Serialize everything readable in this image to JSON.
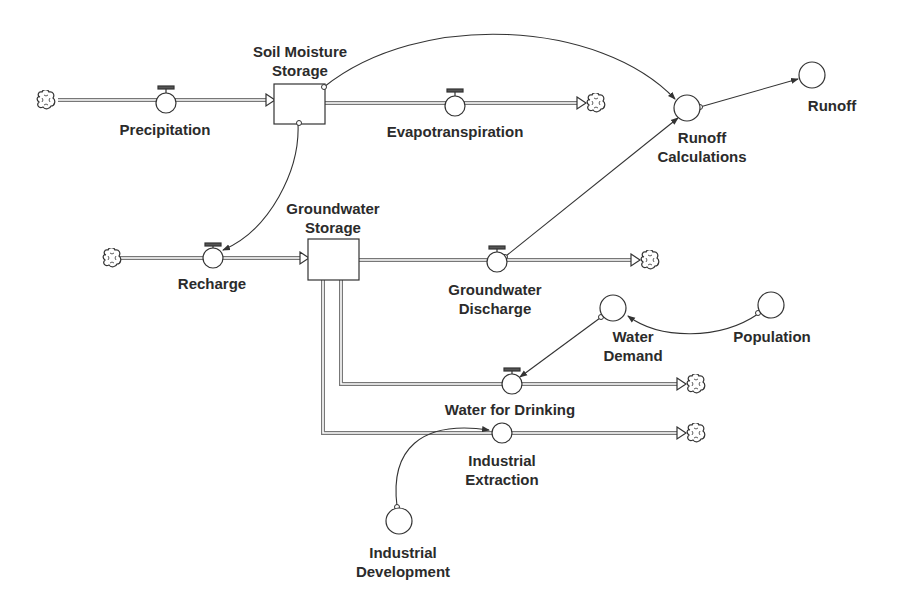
{
  "diagram": {
    "type": "stock-and-flow",
    "stocks": [
      {
        "id": "soil",
        "label": "Soil Moisture Storage",
        "line1": "Soil Moisture",
        "line2": "Storage"
      },
      {
        "id": "gw",
        "label": "Groundwater Storage",
        "line1": "Groundwater",
        "line2": "Storage"
      }
    ],
    "flows": [
      {
        "id": "precip",
        "label": "Precipitation"
      },
      {
        "id": "evap",
        "label": "Evapotranspiration"
      },
      {
        "id": "recharge",
        "label": "Recharge"
      },
      {
        "id": "gwdis",
        "label": "Groundwater Discharge",
        "line1": "Groundwater",
        "line2": "Discharge"
      },
      {
        "id": "drink",
        "label": "Water for Drinking"
      },
      {
        "id": "indext",
        "label": "Industrial Extraction",
        "line1": "Industrial",
        "line2": "Extraction"
      }
    ],
    "auxiliaries": [
      {
        "id": "runcalc",
        "label": "Runoff Calculations",
        "line1": "Runoff",
        "line2": "Calculations"
      },
      {
        "id": "runoff",
        "label": "Runoff"
      },
      {
        "id": "demand",
        "label": "Water Demand",
        "line1": "Water",
        "line2": "Demand"
      },
      {
        "id": "pop",
        "label": "Population"
      },
      {
        "id": "inddev",
        "label": "Industrial Development",
        "line1": "Industrial",
        "line2": "Development"
      }
    ],
    "connectors": [
      [
        "Soil Moisture Storage",
        "Runoff Calculations"
      ],
      [
        "Soil Moisture Storage",
        "Recharge"
      ],
      [
        "Groundwater Discharge",
        "Runoff Calculations"
      ],
      [
        "Runoff Calculations",
        "Runoff"
      ],
      [
        "Water Demand",
        "Water for Drinking"
      ],
      [
        "Population",
        "Water Demand"
      ],
      [
        "Industrial Development",
        "Industrial Extraction"
      ]
    ],
    "colors": {
      "line": "#333333",
      "pipe": "#888888",
      "background": "#ffffff"
    }
  }
}
